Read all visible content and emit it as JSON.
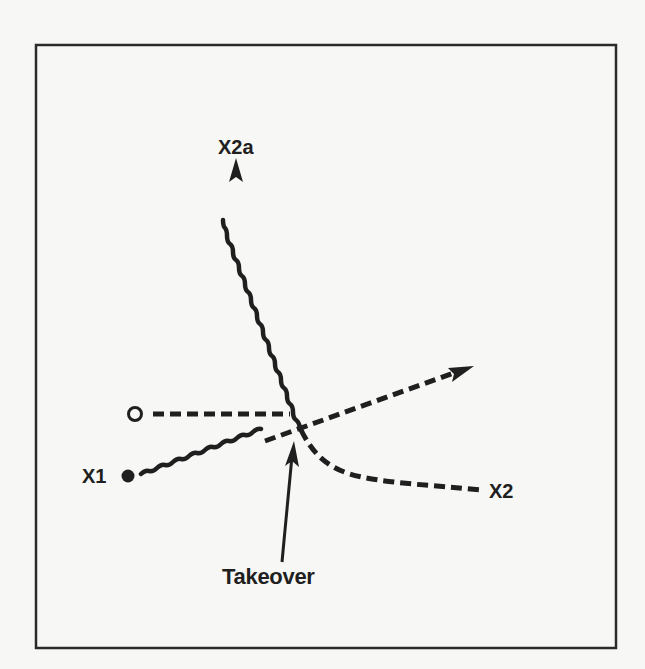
{
  "diagram": {
    "type": "play-diagram",
    "colors": {
      "background": "#f7f7f5",
      "ink": "#1f1f1f",
      "frame": "#2a2a2a"
    },
    "labels": {
      "x2a": "X2a",
      "x1": "X1",
      "x2": "X2",
      "takeover": "Takeover"
    },
    "players": [
      {
        "id": "open-circle",
        "shape": "open-circle",
        "label": ""
      },
      {
        "id": "x1",
        "shape": "filled-circle",
        "label": "X1"
      }
    ],
    "paths": [
      {
        "id": "x1-dribble",
        "style": "wavy",
        "from": "X1",
        "to": "takeover-point"
      },
      {
        "id": "x1-continue",
        "style": "dashed-arrow",
        "from": "takeover-point",
        "to": "right"
      },
      {
        "id": "offense-cut",
        "style": "dashed",
        "from": "O",
        "to": "takeover-point"
      },
      {
        "id": "x2a-dribble",
        "style": "wavy-arrow",
        "from": "takeover-point",
        "to": "X2a"
      },
      {
        "id": "x2-path",
        "style": "dashed",
        "from": "takeover-point",
        "to": "X2"
      },
      {
        "id": "takeover-pointer",
        "style": "solid-arrow",
        "from": "Takeover label",
        "to": "takeover-point"
      }
    ]
  }
}
